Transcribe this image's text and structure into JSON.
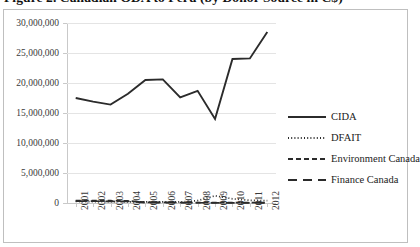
{
  "figure": {
    "title": "Figure 2. Canadian ODA to Peru (by Donor Source in C$)"
  },
  "legend": {
    "position": "right",
    "items": [
      {
        "label": "CIDA",
        "style": "solid"
      },
      {
        "label": "DFAIT",
        "style": "dotted"
      },
      {
        "label": "Environment Canada",
        "style": "dashed"
      },
      {
        "label": "Finance Canada",
        "style": "long-dash"
      }
    ]
  },
  "chart_data": {
    "type": "line",
    "title": "Figure 2. Canadian ODA to Peru (by Donor Source in C$)",
    "xlabel": "",
    "ylabel": "",
    "grid": true,
    "legend_position": "right",
    "categories": [
      "2001",
      "2002",
      "2003",
      "2004",
      "2005",
      "2006",
      "2007",
      "2008",
      "2009",
      "2010",
      "2011",
      "2012"
    ],
    "ylim": [
      0,
      30000000
    ],
    "yticks": [
      0,
      5000000,
      10000000,
      15000000,
      20000000,
      25000000,
      30000000
    ],
    "ytick_labels": [
      "0",
      "5,000,000",
      "10,000,000",
      "15,000,000",
      "20,000,000",
      "25,000,000",
      "30,000,000"
    ],
    "series": [
      {
        "name": "CIDA",
        "style": "solid",
        "color": "#2b2b2b",
        "values": [
          17500000,
          16900000,
          16400000,
          18200000,
          20500000,
          20600000,
          17600000,
          18700000,
          14000000,
          24000000,
          24100000,
          28500000
        ]
      },
      {
        "name": "DFAIT",
        "style": "dotted",
        "color": "#2b2b2b",
        "values": [
          250000,
          230000,
          210000,
          200000,
          190000,
          180000,
          170000,
          400000,
          1200000,
          700000,
          450000,
          400000
        ]
      },
      {
        "name": "Environment Canada",
        "style": "dashed",
        "color": "#2b2b2b",
        "values": [
          400000,
          420000,
          380000,
          360000,
          120000,
          90000,
          80000,
          70000,
          60000,
          60000,
          55000,
          50000
        ]
      },
      {
        "name": "Finance Canada",
        "style": "long-dash",
        "color": "#2b2b2b",
        "values": [
          300000,
          300000,
          280000,
          270000,
          60000,
          50000,
          45000,
          40000,
          35000,
          35000,
          30000,
          30000
        ]
      }
    ]
  }
}
